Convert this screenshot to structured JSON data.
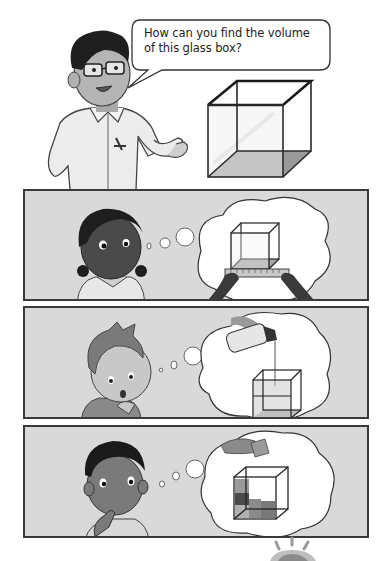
{
  "scene": {
    "teacher": {
      "speech": "How can you find the volume of this glass box?",
      "speech_lines": [
        "How can you find the volume",
        "of this glass box?"
      ]
    },
    "object": "glass-box"
  },
  "panels": [
    {
      "character": "girl",
      "thought": "measure the glass box with a ruler"
    },
    {
      "character": "boy-light-hair",
      "thought": "pour water into the glass box"
    },
    {
      "character": "boy-curly-hair",
      "thought": "fill the glass box with cubes"
    }
  ],
  "footer": {
    "icon": "lightbulb-icon"
  },
  "colors": {
    "panel_bg": "#d9d9d9",
    "panel_border": "#3a3a3a",
    "bubble_border": "#333333"
  }
}
